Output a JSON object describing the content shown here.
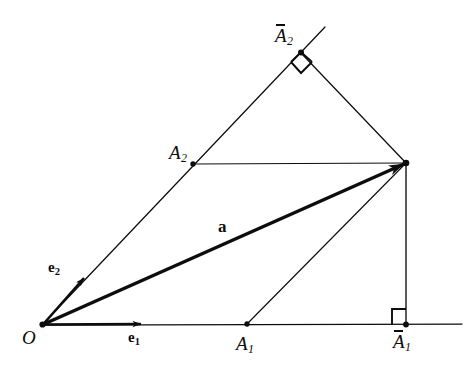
{
  "figure": {
    "kind": "geometry-diagram",
    "background_color": "#ffffff",
    "ink_color": "#0d0d0d",
    "width": 476,
    "height": 369
  },
  "labels": {
    "origin": "O",
    "basis_1": "e",
    "basis_1_sub": "1",
    "basis_2": "e",
    "basis_2_sub": "2",
    "vector": "a",
    "point_a1": "A",
    "point_a1_sub": "1",
    "point_a2": "A",
    "point_a2_sub": "2",
    "point_a1_bar": "A",
    "point_a1_bar_sub": "1",
    "point_a2_bar": "A",
    "point_a2_bar_sub": "2"
  },
  "geometry": {
    "points": {
      "O": [
        42,
        325
      ],
      "A": [
        406,
        163
      ],
      "A1": [
        247,
        324
      ],
      "A2": [
        193,
        164
      ],
      "A1bar": [
        406,
        325
      ],
      "A2bar": [
        301,
        53
      ],
      "e1_tip": [
        142,
        324
      ],
      "e2_tip": [
        85,
        277
      ],
      "axis1_end": [
        462,
        324
      ],
      "axis2_end": [
        325,
        27
      ]
    },
    "segments": [
      {
        "name": "axis-e1",
        "from": [
          42,
          325
        ],
        "to": [
          462,
          324
        ],
        "weight": "thin"
      },
      {
        "name": "axis-e2",
        "from": [
          42,
          325
        ],
        "to": [
          325,
          27
        ],
        "weight": "thin"
      },
      {
        "name": "vector-a",
        "from": [
          42,
          325
        ],
        "to": [
          406,
          163
        ],
        "weight": "bold",
        "arrow": true
      },
      {
        "name": "unit-e1",
        "from": [
          42,
          325
        ],
        "to": [
          142,
          324
        ],
        "weight": "bold",
        "arrow": true
      },
      {
        "name": "unit-e2",
        "from": [
          42,
          325
        ],
        "to": [
          85,
          277
        ],
        "weight": "bold",
        "arrow": true
      },
      {
        "name": "parallel-A2-to-A",
        "from": [
          193,
          164
        ],
        "to": [
          406,
          163
        ],
        "weight": "thin"
      },
      {
        "name": "parallel-A1-to-A",
        "from": [
          247,
          324
        ],
        "to": [
          406,
          163
        ],
        "weight": "thin"
      },
      {
        "name": "perp-A-to-A1bar",
        "from": [
          406,
          163
        ],
        "to": [
          406,
          325
        ],
        "weight": "thin"
      },
      {
        "name": "perp-A-to-A2bar",
        "from": [
          406,
          163
        ],
        "to": [
          301,
          53
        ],
        "weight": "thin"
      }
    ],
    "right_angle_markers": [
      {
        "name": "right-angle-at-A1bar",
        "at": [
          406,
          325
        ],
        "style": "square"
      },
      {
        "name": "right-angle-at-A2bar",
        "at": [
          301,
          53
        ],
        "style": "diamond"
      }
    ],
    "dots": [
      "O",
      "A",
      "A1",
      "A2",
      "A1bar",
      "A2bar"
    ]
  }
}
